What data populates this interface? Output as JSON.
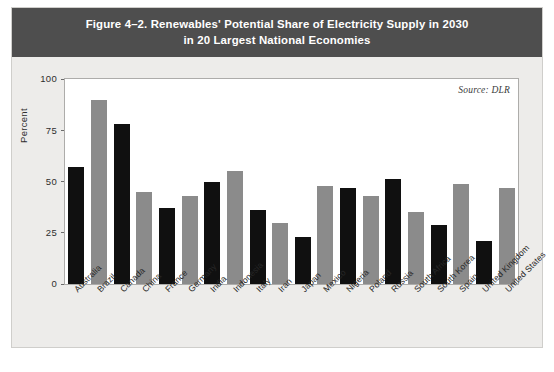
{
  "figure": {
    "title_line_1": "Figure 4–2. Renewables' Potential Share of Electricity Supply in 2030",
    "title_line_2": "in 20 Largest National Economies",
    "source_note": "Source: DLR",
    "header_color": "#4e4e4e",
    "background_color": "#edecea",
    "plot_background": "#ffffff"
  },
  "chart_data": {
    "type": "bar",
    "title": "Figure 4–2. Renewables' Potential Share of Electricity Supply in 2030 in 20 Largest National Economies",
    "xlabel": "",
    "ylabel": "Percent",
    "ylim": [
      0,
      100
    ],
    "yticks": [
      0,
      25,
      50,
      75,
      100
    ],
    "ytick_labels": [
      "0",
      "25",
      "50",
      "75",
      "100"
    ],
    "grid": false,
    "legend": "none",
    "series_colors": {
      "dark": "#101010",
      "light": "#8b8b8b"
    },
    "categories": [
      "Australia",
      "Brazil",
      "Canada",
      "China",
      "France",
      "Germany",
      "India",
      "Indonesia",
      "Italy",
      "Iran",
      "Japan",
      "Mexico",
      "Nigeria",
      "Poland",
      "Russia",
      "South Africa",
      "South Korea",
      "Spain",
      "United Kingdom",
      "United States"
    ],
    "values": [
      57,
      90,
      78,
      45,
      37,
      43,
      50,
      55,
      36,
      30,
      23,
      48,
      47,
      43,
      51,
      35,
      29,
      49,
      21,
      47
    ],
    "bar_colors": [
      "#101010",
      "#8b8b8b",
      "#101010",
      "#8b8b8b",
      "#101010",
      "#8b8b8b",
      "#101010",
      "#8b8b8b",
      "#101010",
      "#8b8b8b",
      "#101010",
      "#8b8b8b",
      "#101010",
      "#8b8b8b",
      "#101010",
      "#8b8b8b",
      "#101010",
      "#8b8b8b",
      "#101010",
      "#8b8b8b"
    ]
  }
}
